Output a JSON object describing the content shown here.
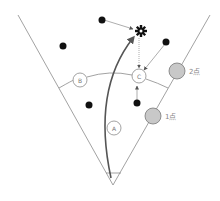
{
  "diagram": {
    "type": "baseball-field-scoring",
    "colors": {
      "line": "#8a8a8a",
      "arrow": "#555555",
      "dot": "#111111",
      "scoring_circle_fill": "#c8c8c8",
      "scoring_circle_stroke": "#777777",
      "label": "#888888"
    },
    "players": [
      {
        "id": "A",
        "label": "A"
      },
      {
        "id": "B",
        "label": "B"
      },
      {
        "id": "C",
        "label": "C"
      }
    ],
    "scoring_zones": [
      {
        "id": "two-points",
        "label": "2点"
      },
      {
        "id": "one-point",
        "label": "1点"
      }
    ],
    "target_icon": "gear-icon",
    "dots_count": 5
  }
}
